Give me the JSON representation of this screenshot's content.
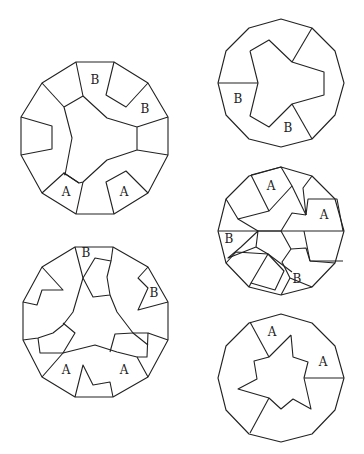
{
  "diagram": {
    "stroke_color": "#222222",
    "background": "#ffffff",
    "figures": [
      {
        "id": "fig-top-left",
        "outer": [
          [
            76,
            62
          ],
          [
            114,
            62
          ],
          [
            148,
            83
          ],
          [
            168,
            117
          ],
          [
            168,
            155
          ],
          [
            148,
            193
          ],
          [
            114,
            214
          ],
          [
            76,
            214
          ],
          [
            42,
            193
          ],
          [
            21,
            155
          ],
          [
            21,
            117
          ],
          [
            42,
            83
          ]
        ],
        "paths": [
          [
            [
              76,
              62
            ],
            [
              83,
              96
            ],
            [
              64,
              107
            ],
            [
              72,
              138
            ],
            [
              65,
              175
            ],
            [
              64,
              173
            ],
            [
              79,
              183
            ]
          ],
          [
            [
              83,
              96
            ],
            [
              107,
              118
            ],
            [
              137,
              127
            ],
            [
              137,
              150
            ],
            [
              107,
              160
            ],
            [
              83,
              182
            ],
            [
              79,
              183
            ],
            [
              64,
              173
            ],
            [
              42,
              193
            ]
          ],
          [
            [
              114,
              62
            ],
            [
              106,
              95
            ],
            [
              126,
              107
            ],
            [
              148,
              83
            ]
          ],
          [
            [
              137,
              127
            ],
            [
              168,
              117
            ]
          ],
          [
            [
              137,
              150
            ],
            [
              168,
              155
            ]
          ],
          [
            [
              21,
              117
            ],
            [
              52,
              126
            ],
            [
              52,
              149
            ],
            [
              21,
              155
            ]
          ],
          [
            [
              42,
              83
            ],
            [
              64,
              107
            ]
          ],
          [
            [
              83,
              182
            ],
            [
              76,
              214
            ]
          ],
          [
            [
              114,
              214
            ],
            [
              106,
              182
            ],
            [
              126,
              171
            ],
            [
              148,
              193
            ]
          ]
        ],
        "labels": [
          {
            "text": "B",
            "x": 95,
            "y": 84
          },
          {
            "text": "B",
            "x": 145,
            "y": 113
          },
          {
            "text": "A",
            "x": 66,
            "y": 196
          },
          {
            "text": "A",
            "x": 124,
            "y": 196
          }
        ]
      },
      {
        "id": "fig-top-right",
        "outer": [
          [
            344,
            83
          ],
          [
            335,
            115
          ],
          [
            312,
            139
          ],
          [
            281,
            147
          ],
          [
            249,
            139
          ],
          [
            226,
            115
          ],
          [
            218,
            83
          ],
          [
            226,
            51
          ],
          [
            249,
            28
          ],
          [
            281,
            19
          ],
          [
            312,
            28
          ],
          [
            335,
            51
          ]
        ],
        "paths": [
          [
            [
              250,
              51
            ],
            [
              269,
              40
            ],
            [
              292,
              62
            ],
            [
              324,
              72
            ],
            [
              324,
              95
            ],
            [
              292,
              104
            ],
            [
              269,
              127
            ],
            [
              250,
              116
            ],
            [
              258,
              83
            ],
            [
              250,
              51
            ]
          ],
          [
            [
              292,
              62
            ],
            [
              312,
              28
            ]
          ],
          [
            [
              258,
              83
            ],
            [
              218,
              83
            ]
          ],
          [
            [
              292,
              104
            ],
            [
              312,
              139
            ]
          ]
        ],
        "labels": [
          {
            "text": "B",
            "x": 238,
            "y": 103
          },
          {
            "text": "B",
            "x": 288,
            "y": 132
          }
        ]
      },
      {
        "id": "fig-middle-right",
        "outer": [
          [
            344,
            231
          ],
          [
            335,
            263
          ],
          [
            312,
            287
          ],
          [
            281,
            295
          ],
          [
            249,
            287
          ],
          [
            226,
            263
          ],
          [
            218,
            231
          ],
          [
            226,
            199
          ],
          [
            249,
            176
          ],
          [
            281,
            167
          ],
          [
            312,
            176
          ],
          [
            335,
            199
          ]
        ],
        "paths": [
          [
            [
              218,
              231
            ],
            [
              304,
              231
            ]
          ],
          [
            [
              304,
              231
            ],
            [
              344,
              231
            ]
          ],
          [
            [
              226,
              199
            ],
            [
              238,
              219
            ],
            [
              269,
              211
            ],
            [
              251,
              175
            ]
          ],
          [
            [
              251,
              175
            ],
            [
              281,
              167
            ],
            [
              292,
              186
            ],
            [
              269,
              211
            ]
          ],
          [
            [
              238,
              219
            ],
            [
              258,
              231
            ],
            [
              256,
              247
            ],
            [
              228,
              258
            ],
            [
              241,
              247
            ],
            [
              258,
              231
            ]
          ],
          [
            [
              258,
              231
            ],
            [
              281,
              231
            ],
            [
              292,
              213
            ],
            [
              306,
              215
            ]
          ],
          [
            [
              292,
              186
            ],
            [
              306,
              215
            ]
          ],
          [
            [
              312,
              176
            ],
            [
              303,
              188
            ],
            [
              306,
              215
            ]
          ],
          [
            [
              306,
              215
            ],
            [
              308,
              199
            ],
            [
              337,
              199
            ],
            [
              343,
              231
            ]
          ],
          [
            [
              304,
              231
            ],
            [
              310,
              261
            ],
            [
              335,
              263
            ]
          ],
          [
            [
              310,
              261
            ],
            [
              343,
              261
            ]
          ],
          [
            [
              281,
              231
            ],
            [
              291,
              249
            ],
            [
              306,
              248
            ],
            [
              310,
              261
            ]
          ],
          [
            [
              291,
              249
            ],
            [
              282,
              262
            ],
            [
              290,
              278
            ],
            [
              312,
              287
            ]
          ],
          [
            [
              256,
              247
            ],
            [
              268,
              254
            ],
            [
              292,
              272
            ]
          ],
          [
            [
              226,
              263
            ],
            [
              236,
              252
            ],
            [
              268,
              254
            ],
            [
              284,
              271
            ],
            [
              275,
              290
            ],
            [
              251,
              283
            ],
            [
              268,
              254
            ]
          ],
          [
            [
              249,
              287
            ],
            [
              251,
              283
            ]
          ],
          [
            [
              281,
              295
            ],
            [
              290,
              278
            ]
          ]
        ],
        "labels": [
          {
            "text": "A",
            "x": 271,
            "y": 190
          },
          {
            "text": "A",
            "x": 324,
            "y": 219
          },
          {
            "text": "B",
            "x": 229,
            "y": 243
          },
          {
            "text": "B",
            "x": 297,
            "y": 283
          }
        ]
      },
      {
        "id": "fig-bottom-left",
        "outer": [
          [
            75,
            247
          ],
          [
            113,
            247
          ],
          [
            148,
            267
          ],
          [
            168,
            302
          ],
          [
            168,
            340
          ],
          [
            148,
            377
          ],
          [
            113,
            397
          ],
          [
            75,
            397
          ],
          [
            42,
            377
          ],
          [
            23,
            340
          ],
          [
            23,
            302
          ],
          [
            42,
            267
          ]
        ],
        "paths": [
          [
            [
              75,
              247
            ],
            [
              83,
              278
            ],
            [
              73,
              312
            ],
            [
              63,
              325
            ],
            [
              53,
              333
            ],
            [
              38,
              338
            ],
            [
              23,
              340
            ]
          ],
          [
            [
              83,
              278
            ],
            [
              95,
              258
            ],
            [
              111,
              261
            ],
            [
              107,
              277
            ],
            [
              110,
              295
            ],
            [
              93,
              297
            ],
            [
              83,
              278
            ]
          ],
          [
            [
              113,
              247
            ],
            [
              111,
              261
            ]
          ],
          [
            [
              110,
              295
            ],
            [
              117,
              312
            ],
            [
              133,
              333
            ],
            [
              148,
              345
            ]
          ],
          [
            [
              42,
              267
            ],
            [
              63,
              290
            ],
            [
              42,
              290
            ],
            [
              37,
              305
            ],
            [
              23,
              302
            ]
          ],
          [
            [
              148,
              267
            ],
            [
              138,
              278
            ],
            [
              148,
              288
            ],
            [
              138,
              310
            ],
            [
              168,
              302
            ]
          ],
          [
            [
              38,
              338
            ],
            [
              40,
              353
            ],
            [
              63,
              353
            ],
            [
              75,
              333
            ],
            [
              63,
              323
            ]
          ],
          [
            [
              42,
              377
            ],
            [
              63,
              353
            ],
            [
              95,
              345
            ],
            [
              117,
              352
            ],
            [
              137,
              357
            ],
            [
              148,
              377
            ]
          ],
          [
            [
              133,
              333
            ],
            [
              148,
              333
            ],
            [
              147,
              357
            ],
            [
              137,
              357
            ]
          ],
          [
            [
              133,
              333
            ],
            [
              115,
              334
            ],
            [
              110,
              352
            ]
          ],
          [
            [
              148,
              333
            ],
            [
              168,
              340
            ]
          ],
          [
            [
              75,
              397
            ],
            [
              83,
              365
            ],
            [
              93,
              385
            ],
            [
              110,
              382
            ],
            [
              113,
              397
            ]
          ]
        ],
        "labels": [
          {
            "text": "B",
            "x": 86,
            "y": 257
          },
          {
            "text": "B",
            "x": 154,
            "y": 297
          },
          {
            "text": "A",
            "x": 66,
            "y": 374
          },
          {
            "text": "A",
            "x": 124,
            "y": 374
          }
        ]
      },
      {
        "id": "fig-bottom-right",
        "outer": [
          [
            344,
            378
          ],
          [
            335,
            410
          ],
          [
            312,
            434
          ],
          [
            281,
            442
          ],
          [
            249,
            434
          ],
          [
            226,
            410
          ],
          [
            218,
            378
          ],
          [
            226,
            346
          ],
          [
            249,
            323
          ],
          [
            281,
            314
          ],
          [
            312,
            323
          ],
          [
            335,
            346
          ]
        ],
        "paths": [
          [
            [
              291,
              335
            ],
            [
              293,
              357
            ],
            [
              308,
              362
            ],
            [
              304,
              378
            ],
            [
              311,
              409
            ],
            [
              293,
              399
            ],
            [
              281,
              409
            ],
            [
              269,
              398
            ],
            [
              238,
              389
            ],
            [
              257,
              379
            ],
            [
              254,
              361
            ],
            [
              269,
              357
            ],
            [
              291,
              335
            ]
          ],
          [
            [
              269,
              357
            ],
            [
              250,
              322
            ]
          ],
          [
            [
              304,
              378
            ],
            [
              344,
              378
            ]
          ],
          [
            [
              269,
              398
            ],
            [
              250,
              433
            ]
          ]
        ],
        "labels": [
          {
            "text": "A",
            "x": 272,
            "y": 336
          },
          {
            "text": "A",
            "x": 323,
            "y": 366
          }
        ]
      }
    ]
  }
}
